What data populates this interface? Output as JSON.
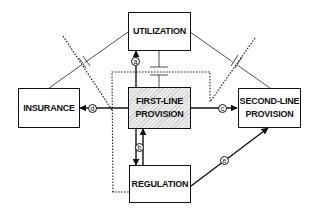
{
  "diagram": {
    "nodes": [
      {
        "id": "utilization",
        "lines": [
          "UTILIZATION"
        ],
        "hatched": false
      },
      {
        "id": "insurance",
        "lines": [
          "INSURANCE"
        ],
        "hatched": false
      },
      {
        "id": "first_line",
        "lines": [
          "FIRST-LINE",
          "PROVISION"
        ],
        "hatched": true
      },
      {
        "id": "second_line",
        "lines": [
          "SECOND-LINE",
          "PROVISION"
        ],
        "hatched": false
      },
      {
        "id": "regulation",
        "lines": [
          "REGULATION"
        ],
        "hatched": false
      }
    ],
    "edge_labels": {
      "a": "a",
      "b": "b",
      "c": "c",
      "d": "d",
      "e": "e"
    },
    "edges": [
      {
        "label": "a",
        "from": "first_line",
        "to": "utilization",
        "style": "arrow"
      },
      {
        "label": "b",
        "from": "first_line",
        "to": "regulation",
        "style": "bidirectional-arrows"
      },
      {
        "label": "c",
        "from": "first_line",
        "to": "second_line",
        "style": "arrow"
      },
      {
        "label": "d",
        "from": "first_line",
        "to": "insurance",
        "style": "arrow"
      },
      {
        "label": "e",
        "from": "regulation",
        "to": "second_line",
        "style": "arrow"
      },
      {
        "from": "utilization",
        "to": "insurance",
        "style": "thin-line-with-break"
      },
      {
        "from": "utilization",
        "to": "second_line",
        "style": "thin-line-with-break"
      },
      {
        "from": "utilization",
        "to": "first_line",
        "style": "thin-line-with-bar"
      },
      {
        "from": "regulation",
        "to": "boundary",
        "style": "dotted-boundary"
      }
    ]
  }
}
